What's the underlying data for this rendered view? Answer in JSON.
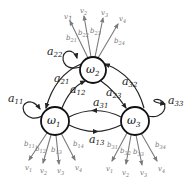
{
  "diagram": {
    "type": "hidden-markov-model-state-diagram",
    "colors": {
      "state_stroke": "#111111",
      "transition": "#222222",
      "emission": "#7a7a7a",
      "emission_label": "#777777"
    },
    "states": [
      {
        "id": "w1",
        "symbol": "ω",
        "sub": "1"
      },
      {
        "id": "w2",
        "symbol": "ω",
        "sub": "2"
      },
      {
        "id": "w3",
        "symbol": "ω",
        "sub": "3"
      }
    ],
    "transitions": [
      {
        "from": "w1",
        "to": "w1",
        "symbol": "a",
        "sub": "11"
      },
      {
        "from": "w2",
        "to": "w2",
        "symbol": "a",
        "sub": "22"
      },
      {
        "from": "w3",
        "to": "w3",
        "symbol": "a",
        "sub": "33"
      },
      {
        "from": "w2",
        "to": "w1",
        "symbol": "a",
        "sub": "21"
      },
      {
        "from": "w1",
        "to": "w2",
        "symbol": "a",
        "sub": "12"
      },
      {
        "from": "w3",
        "to": "w2",
        "symbol": "a",
        "sub": "32"
      },
      {
        "from": "w2",
        "to": "w3",
        "symbol": "a",
        "sub": "23"
      },
      {
        "from": "w3",
        "to": "w1",
        "symbol": "a",
        "sub": "31"
      },
      {
        "from": "w1",
        "to": "w3",
        "symbol": "a",
        "sub": "13"
      }
    ],
    "emissions": {
      "w2": [
        {
          "b": "b",
          "bsub": "21",
          "v": "v",
          "vsub": "1"
        },
        {
          "b": "b",
          "bsub": "22",
          "v": "v",
          "vsub": "2"
        },
        {
          "b": "b",
          "bsub": "23",
          "v": "v",
          "vsub": "3"
        },
        {
          "b": "b",
          "bsub": "24",
          "v": "v",
          "vsub": "4"
        }
      ],
      "w1": [
        {
          "b": "b",
          "bsub": "11",
          "v": "v",
          "vsub": "1"
        },
        {
          "b": "b",
          "bsub": "12",
          "v": "v",
          "vsub": "2"
        },
        {
          "b": "b",
          "bsub": "13",
          "v": "v",
          "vsub": "3"
        },
        {
          "b": "b",
          "bsub": "14",
          "v": "v",
          "vsub": "4"
        }
      ],
      "w3": [
        {
          "b": "b",
          "bsub": "31",
          "v": "v",
          "vsub": "1"
        },
        {
          "b": "b",
          "bsub": "32",
          "v": "v",
          "vsub": "2"
        },
        {
          "b": "b",
          "bsub": "33",
          "v": "v",
          "vsub": "3"
        },
        {
          "b": "b",
          "bsub": "34",
          "v": "v",
          "vsub": "4"
        }
      ]
    }
  }
}
